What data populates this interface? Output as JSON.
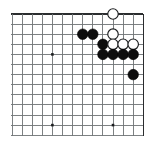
{
  "figure": {
    "kind": "go-board-diagram",
    "board": {
      "columns_shown": 14,
      "rows_shown": 13,
      "cell_size": 10.1,
      "origin_x": 12,
      "origin_y": 14,
      "line_color": "#6f7376",
      "edge_color": "#2b2d2f",
      "background_color": "#ffffff",
      "edges": {
        "top": true,
        "right": true,
        "left": false,
        "bottom": false
      }
    },
    "star_points": [
      {
        "col": 4,
        "row": 4
      },
      {
        "col": 4,
        "row": 11
      },
      {
        "col": 10,
        "row": 11
      }
    ],
    "stones": [
      {
        "color": "white",
        "col": 10,
        "row": 0
      },
      {
        "color": "black",
        "col": 7,
        "row": 2
      },
      {
        "color": "black",
        "col": 8,
        "row": 2
      },
      {
        "color": "white",
        "col": 10,
        "row": 2
      },
      {
        "color": "black",
        "col": 9,
        "row": 3
      },
      {
        "color": "white",
        "col": 10,
        "row": 3
      },
      {
        "color": "white",
        "col": 11,
        "row": 3
      },
      {
        "color": "white",
        "col": 12,
        "row": 3
      },
      {
        "color": "black",
        "col": 9,
        "row": 4
      },
      {
        "color": "black",
        "col": 10,
        "row": 4
      },
      {
        "color": "black",
        "col": 11,
        "row": 4
      },
      {
        "color": "black",
        "col": 12,
        "row": 4
      },
      {
        "color": "black",
        "col": 12,
        "row": 6
      }
    ],
    "counts": {
      "black_stones": 8,
      "white_stones": 5,
      "total_stones": 13
    }
  }
}
